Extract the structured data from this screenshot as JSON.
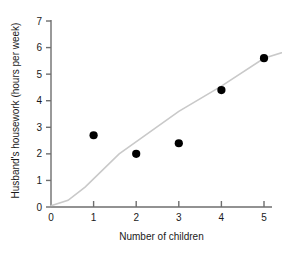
{
  "chart_data": {
    "type": "scatter",
    "title": "",
    "xlabel": "Number of children",
    "ylabel": "Husband's housework (hours per week)",
    "x": [
      1,
      2,
      3,
      4,
      5
    ],
    "values": [
      2.7,
      2.0,
      2.4,
      4.4,
      5.6
    ],
    "series": [
      {
        "name": "Husband's housework",
        "type": "scatter",
        "values": [
          2.7,
          2.0,
          2.4,
          4.4,
          5.6
        ]
      },
      {
        "name": "trend",
        "type": "line",
        "points": [
          [
            0.0,
            0.05
          ],
          [
            0.4,
            0.25
          ],
          [
            0.8,
            0.75
          ],
          [
            1.6,
            2.0
          ],
          [
            3.0,
            3.6
          ],
          [
            4.0,
            4.55
          ],
          [
            5.0,
            5.6
          ],
          [
            5.8,
            6.0
          ]
        ]
      }
    ],
    "xticks": [
      "0",
      "1",
      "2",
      "3",
      "4",
      "5"
    ],
    "xtick_values": [
      0,
      1,
      2,
      3,
      4,
      5
    ],
    "yticks": [
      "0",
      "1",
      "2",
      "3",
      "4",
      "5",
      "6",
      "7"
    ],
    "ytick_values": [
      0,
      1,
      2,
      3,
      4,
      5,
      6,
      7
    ],
    "xlim": [
      0,
      5.2
    ],
    "ylim": [
      0,
      7
    ],
    "grid": false,
    "legend": "none",
    "marker_color": "#000000",
    "line_color": "#c9c9c9",
    "axis_color": "#6e6e6e"
  }
}
